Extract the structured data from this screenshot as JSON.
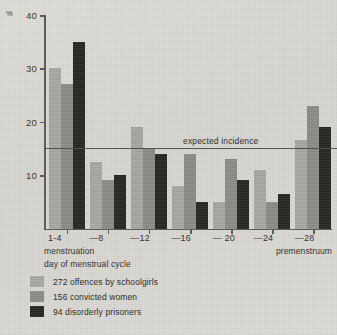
{
  "chart_data": {
    "type": "bar",
    "title": "",
    "xlabel": "day of menstrual cycle",
    "ylabel": "%",
    "ylim": [
      0,
      40
    ],
    "yticks": [
      10,
      20,
      30,
      40
    ],
    "ytick_labels": [
      "10",
      "20",
      "30",
      "40"
    ],
    "grid": false,
    "legend_position": "below-axis-left",
    "categories": [
      "1-4",
      "—8",
      "—12",
      "—16",
      "— 20",
      "—24",
      "—28"
    ],
    "series": [
      {
        "name": "272 offences by schoolgirls",
        "color": "#a9a8a2",
        "values": [
          30,
          12.5,
          19,
          8,
          5,
          11,
          16.5
        ]
      },
      {
        "name": "156 convicted women",
        "color": "#8d8c86",
        "values": [
          27,
          9,
          15,
          14,
          13,
          5,
          23
        ]
      },
      {
        "name": "94 disorderly prisoners",
        "color": "#272724",
        "values": [
          35,
          10,
          14,
          5,
          9,
          6.5,
          19
        ]
      }
    ],
    "annotations": [
      {
        "name": "expected-incidence",
        "label": "expected incidence",
        "value": 15,
        "type": "hline"
      }
    ],
    "axis_captions": {
      "left": "menstruation",
      "right": "premenstruum"
    }
  },
  "axis": {
    "percent_symbol": "%",
    "x_axis_title": "day of menstrual cycle",
    "caption_left": "menstruation",
    "caption_right": "premenstruum"
  },
  "annotation": {
    "expected_incidence_label": "expected incidence"
  },
  "legend": {
    "items": [
      {
        "label": "272 offences by schoolgirls"
      },
      {
        "label": "156 convicted women"
      },
      {
        "label": "94 disorderly prisoners"
      }
    ]
  }
}
